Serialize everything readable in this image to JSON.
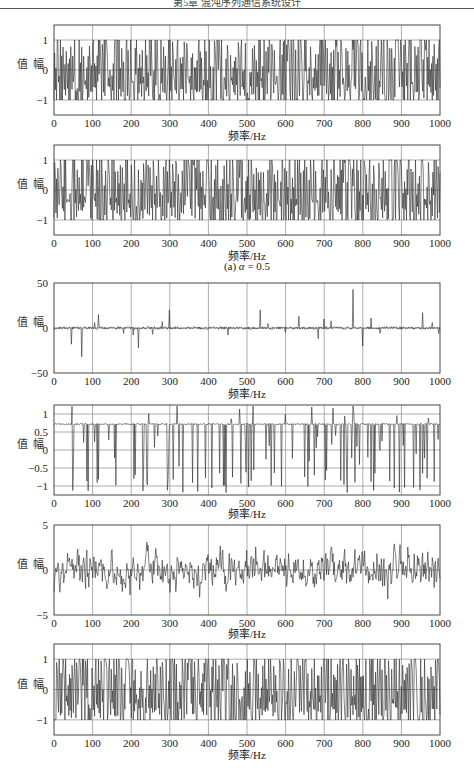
{
  "header": {
    "text": "第5章  混沌序列通信系统设计"
  },
  "caption": {
    "prefix": "(a) ",
    "symbol": "α",
    "suffix": " = 0.5"
  },
  "chart_data": [
    {
      "type": "line",
      "title": "",
      "xlabel": "频率/Hz",
      "ylabel": "幅值",
      "xlim": [
        0,
        1000
      ],
      "ylim": [
        -1.5,
        1.5
      ],
      "xticks": [
        0,
        100,
        200,
        300,
        400,
        500,
        600,
        700,
        800,
        900,
        1000
      ],
      "yticks": [
        -1,
        0,
        1
      ],
      "grid": true,
      "signal": {
        "kind": "bounded_chaotic",
        "amplitude": 1.0,
        "seed": 11
      },
      "description": "Dense chaotic sequence bounded in [-1, 1]"
    },
    {
      "type": "line",
      "title": "",
      "xlabel": "频率/Hz",
      "ylabel": "幅值",
      "xlim": [
        0,
        1000
      ],
      "ylim": [
        -1.5,
        1.5
      ],
      "xticks": [
        0,
        100,
        200,
        300,
        400,
        500,
        600,
        700,
        800,
        900,
        1000
      ],
      "yticks": [
        -1,
        0,
        1
      ],
      "grid": true,
      "signal": {
        "kind": "bounded_chaotic",
        "amplitude": 1.0,
        "seed": 23
      },
      "caption": "(a) α = 0.5",
      "description": "Dense chaotic sequence bounded in [-1, 1]"
    },
    {
      "type": "line",
      "title": "",
      "xlabel": "频率/Hz",
      "ylabel": "幅值",
      "xlim": [
        0,
        1000
      ],
      "ylim": [
        -50,
        50
      ],
      "xticks": [
        0,
        100,
        200,
        300,
        400,
        500,
        600,
        700,
        800,
        900,
        1000
      ],
      "yticks": [
        -50,
        0,
        50
      ],
      "grid": true,
      "signal": {
        "kind": "spiky_noise",
        "baseline_noise": 1.5,
        "seed": 37
      },
      "spikes": [
        {
          "x": 45,
          "y": -18
        },
        {
          "x": 72,
          "y": -32
        },
        {
          "x": 105,
          "y": 6
        },
        {
          "x": 115,
          "y": 15
        },
        {
          "x": 180,
          "y": -6
        },
        {
          "x": 205,
          "y": -8
        },
        {
          "x": 218,
          "y": -22
        },
        {
          "x": 255,
          "y": -7
        },
        {
          "x": 280,
          "y": 7
        },
        {
          "x": 298,
          "y": 20
        },
        {
          "x": 450,
          "y": -8
        },
        {
          "x": 535,
          "y": 20
        },
        {
          "x": 555,
          "y": 5
        },
        {
          "x": 600,
          "y": -5
        },
        {
          "x": 635,
          "y": 13
        },
        {
          "x": 685,
          "y": -12
        },
        {
          "x": 700,
          "y": 10
        },
        {
          "x": 718,
          "y": 8
        },
        {
          "x": 775,
          "y": 43
        },
        {
          "x": 800,
          "y": -20
        },
        {
          "x": 822,
          "y": 11
        },
        {
          "x": 845,
          "y": -6
        },
        {
          "x": 955,
          "y": 17
        },
        {
          "x": 980,
          "y": 6
        },
        {
          "x": 997,
          "y": -6
        }
      ],
      "description": "Near-zero noise floor with sparse positive and negative spikes"
    },
    {
      "type": "line",
      "title": "",
      "xlabel": "频率/Hz",
      "ylabel": "幅值",
      "xlim": [
        0,
        1000
      ],
      "ylim": [
        -1.25,
        1.25
      ],
      "xticks": [
        0,
        100,
        200,
        300,
        400,
        500,
        600,
        700,
        800,
        900,
        1000
      ],
      "yticks": [
        -1,
        -0.5,
        0,
        0.5,
        1
      ],
      "grid": true,
      "signal": {
        "kind": "clipped_drops",
        "baseline": 0.72,
        "seed": 53
      },
      "description": "Signal resting near 0.72 with frequent downward drops toward -1.2 and upward spikes to ~1.2"
    },
    {
      "type": "line",
      "title": "",
      "xlabel": "频率/Hz",
      "ylabel": "幅值",
      "xlim": [
        0,
        1000
      ],
      "ylim": [
        -5,
        5
      ],
      "xticks": [
        0,
        100,
        200,
        300,
        400,
        500,
        600,
        700,
        800,
        900,
        1000
      ],
      "yticks": [
        -5,
        0,
        5
      ],
      "grid": true,
      "signal": {
        "kind": "gaussian_noise",
        "sigma": 1.3,
        "peak": 4.2,
        "seed": 71
      },
      "description": "Noise-like signal with spikes up to about ±4"
    },
    {
      "type": "line",
      "title": "",
      "xlabel": "频率/Hz",
      "ylabel": "幅值",
      "xlim": [
        0,
        1000
      ],
      "ylim": [
        -1.5,
        1.5
      ],
      "xticks": [
        0,
        100,
        200,
        300,
        400,
        500,
        600,
        700,
        800,
        900,
        1000
      ],
      "yticks": [
        -1,
        0,
        1
      ],
      "grid": true,
      "signal": {
        "kind": "bounded_chaotic",
        "amplitude": 1.0,
        "seed": 89
      },
      "description": "Dense chaotic sequence bounded in [-1, 1]"
    }
  ],
  "layout": {
    "plot_left": 54,
    "plot_right": 440,
    "panels": [
      {
        "top": 25,
        "height": 90,
        "xlabel_top": 127,
        "caption_top": null
      },
      {
        "top": 145,
        "height": 90,
        "xlabel_top": 247,
        "caption_top": 260
      },
      {
        "top": 283,
        "height": 90,
        "xlabel_top": 385,
        "caption_top": null
      },
      {
        "top": 405,
        "height": 90,
        "xlabel_top": 505,
        "caption_top": null
      },
      {
        "top": 525,
        "height": 90,
        "xlabel_top": 625,
        "caption_top": null
      },
      {
        "top": 644,
        "height": 91,
        "xlabel_top": 746,
        "caption_top": null
      }
    ],
    "colors": {
      "line": "#2a2a2a",
      "grid": "#8a8a8a",
      "frame": "#333333"
    }
  }
}
